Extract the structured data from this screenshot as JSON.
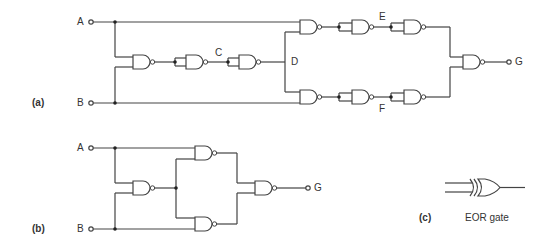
{
  "diagram_a": {
    "part_label": "(a)",
    "inputs": [
      "A",
      "B"
    ],
    "nodes": [
      "C",
      "D",
      "E",
      "F"
    ],
    "output": "G",
    "gates": [
      {
        "id": "a1",
        "type": "NAND",
        "inputs": [
          "A",
          "B"
        ],
        "output": "n1"
      },
      {
        "id": "a2",
        "type": "NAND",
        "inputs": [
          "n1",
          "n1"
        ],
        "output": "C"
      },
      {
        "id": "a3",
        "type": "NAND",
        "inputs": [
          "C",
          "C"
        ],
        "output": "D"
      },
      {
        "id": "a4",
        "type": "NAND",
        "inputs": [
          "A",
          "D"
        ],
        "output": "n4"
      },
      {
        "id": "a5",
        "type": "NAND",
        "inputs": [
          "n4",
          "n4"
        ],
        "output": "E"
      },
      {
        "id": "a6",
        "type": "NAND",
        "inputs": [
          "E",
          "E"
        ],
        "output": "n6"
      },
      {
        "id": "a7",
        "type": "NAND",
        "inputs": [
          "D",
          "B"
        ],
        "output": "n7"
      },
      {
        "id": "a8",
        "type": "NAND",
        "inputs": [
          "n7",
          "n7"
        ],
        "output": "F"
      },
      {
        "id": "a9",
        "type": "NAND",
        "inputs": [
          "F",
          "F"
        ],
        "output": "n9"
      },
      {
        "id": "a10",
        "type": "NAND",
        "inputs": [
          "n6",
          "n9"
        ],
        "output": "G"
      }
    ]
  },
  "diagram_b": {
    "part_label": "(b)",
    "inputs": [
      "A",
      "B"
    ],
    "output": "G",
    "gates": [
      {
        "id": "b1",
        "type": "NAND",
        "inputs": [
          "A",
          "B"
        ],
        "output": "m"
      },
      {
        "id": "b2",
        "type": "NAND",
        "inputs": [
          "A",
          "m"
        ],
        "output": "p"
      },
      {
        "id": "b3",
        "type": "NAND",
        "inputs": [
          "m",
          "B"
        ],
        "output": "q"
      },
      {
        "id": "b4",
        "type": "NAND",
        "inputs": [
          "p",
          "q"
        ],
        "output": "G"
      }
    ]
  },
  "diagram_c": {
    "part_label": "(c)",
    "caption": "EOR gate",
    "gate_type": "XOR"
  }
}
